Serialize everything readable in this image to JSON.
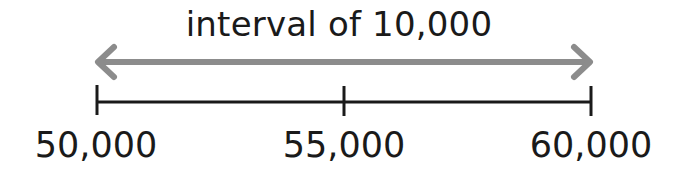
{
  "diagram": {
    "title": "interval of 10,000",
    "arrow_color": "#8c8c8c",
    "line_color": "#1a1a1a",
    "ticks": [
      {
        "label": "50,000",
        "value": 50000
      },
      {
        "label": "55,000",
        "value": 55000
      },
      {
        "label": "60,000",
        "value": 60000
      }
    ]
  }
}
